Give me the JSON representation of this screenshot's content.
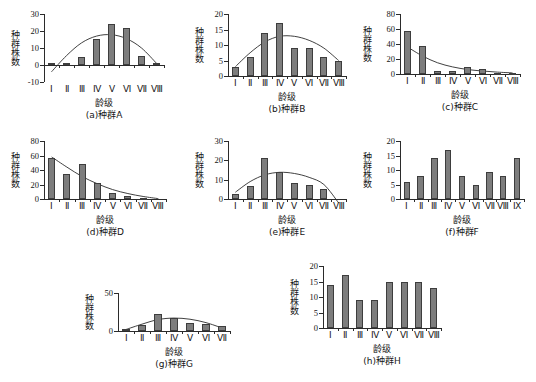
{
  "figure": {
    "axis_titles": {
      "y": "种群株数",
      "x": "龄级"
    },
    "bar_color": "#7d7d7d",
    "bar_edge_color": "#3d3d3d",
    "axis_color": "#2b2b2b",
    "background": "#ffffff"
  },
  "chart_data": [
    {
      "type": "bar",
      "id": "a",
      "title": "(a)种群A",
      "xlabel": "龄级",
      "ylabel": "种群株数",
      "categories": [
        "Ⅰ",
        "Ⅱ",
        "Ⅲ",
        "Ⅳ",
        "Ⅴ",
        "Ⅵ",
        "Ⅶ",
        "Ⅷ"
      ],
      "values": [
        1,
        1,
        5,
        15.5,
        24,
        22,
        5.5,
        1
      ],
      "yticks": [
        -10,
        0,
        10,
        20,
        30
      ],
      "ylim": [
        -10,
        30
      ],
      "grid": false,
      "legend": "none",
      "trend_curve": {
        "present": true,
        "shape": "unimodal-hump",
        "values": [
          -4,
          5.5,
          13,
          17,
          17.8,
          15.5,
          10,
          1
        ]
      }
    },
    {
      "type": "bar",
      "id": "b",
      "title": "(b)种群B",
      "xlabel": "龄级",
      "ylabel": "种群株数",
      "categories": [
        "Ⅰ",
        "Ⅱ",
        "Ⅲ",
        "Ⅳ",
        "Ⅴ",
        "Ⅵ",
        "Ⅶ",
        "Ⅷ"
      ],
      "values": [
        3,
        6,
        14,
        17,
        9,
        9,
        6,
        5
      ],
      "yticks": [
        0,
        5,
        10,
        15,
        20
      ],
      "ylim": [
        0,
        20
      ],
      "grid": false,
      "legend": "none",
      "trend_curve": {
        "present": true,
        "shape": "unimodal-hump",
        "values": [
          3,
          7.5,
          11,
          12.8,
          12.8,
          11.5,
          9,
          5
        ]
      }
    },
    {
      "type": "bar",
      "id": "c",
      "title": "(c)种群C",
      "xlabel": "龄级",
      "ylabel": "种群株数",
      "categories": [
        "Ⅰ",
        "Ⅱ",
        "Ⅲ",
        "Ⅳ",
        "Ⅴ",
        "Ⅵ",
        "Ⅶ",
        "Ⅷ"
      ],
      "values": [
        58,
        38,
        4,
        4,
        9,
        7,
        2,
        2
      ],
      "yticks": [
        0,
        20,
        40,
        60,
        80
      ],
      "ylim": [
        0,
        80
      ],
      "grid": false,
      "legend": "none",
      "trend_curve": {
        "present": true,
        "shape": "decay",
        "values": [
          36,
          24,
          15,
          9.5,
          6,
          4,
          2.5,
          1.5
        ]
      }
    },
    {
      "type": "bar",
      "id": "d",
      "title": "(d)种群D",
      "xlabel": "龄级",
      "ylabel": "种群株数",
      "categories": [
        "Ⅰ",
        "Ⅱ",
        "Ⅲ",
        "Ⅳ",
        "Ⅴ",
        "Ⅵ",
        "Ⅶ",
        "Ⅷ"
      ],
      "values": [
        57,
        35,
        48,
        22,
        8,
        4,
        1.5,
        0.5
      ],
      "yticks": [
        0,
        20,
        40,
        60,
        80
      ],
      "ylim": [
        0,
        80
      ],
      "grid": false,
      "legend": "none",
      "trend_curve": {
        "present": true,
        "shape": "decay",
        "values": [
          58,
          44,
          31,
          21,
          13,
          7.5,
          3.5,
          0.5
        ]
      }
    },
    {
      "type": "bar",
      "id": "e",
      "title": "(e)种群E",
      "xlabel": "龄级",
      "ylabel": "种群株数",
      "categories": [
        "Ⅰ",
        "Ⅱ",
        "Ⅲ",
        "Ⅳ",
        "Ⅴ",
        "Ⅵ",
        "Ⅶ",
        "Ⅷ"
      ],
      "values": [
        2.5,
        6.5,
        21,
        14,
        8.5,
        7,
        5,
        0
      ],
      "yticks": [
        0,
        10,
        20,
        30
      ],
      "ylim": [
        0,
        30
      ],
      "grid": false,
      "legend": "none",
      "trend_curve": {
        "present": true,
        "shape": "unimodal-hump",
        "values": [
          3.5,
          9,
          12.5,
          13.8,
          13.2,
          11.2,
          7.5,
          -2
        ]
      }
    },
    {
      "type": "bar",
      "id": "f",
      "title": "(f)种群F",
      "xlabel": "龄级",
      "ylabel": "种群株数",
      "categories": [
        "Ⅰ",
        "Ⅱ",
        "Ⅲ",
        "Ⅳ",
        "Ⅴ",
        "Ⅵ",
        "Ⅶ",
        "Ⅷ",
        "Ⅸ"
      ],
      "values": [
        6,
        8,
        14.3,
        17,
        8,
        5,
        9.2,
        8,
        14.2
      ],
      "yticks": [
        0,
        5,
        10,
        15,
        20
      ],
      "ylim": [
        0,
        20
      ],
      "grid": false,
      "legend": "none",
      "trend_curve": {
        "present": false,
        "shape": "none",
        "values": []
      }
    },
    {
      "type": "bar",
      "id": "g",
      "title": "(g)种群G",
      "xlabel": "龄级",
      "ylabel": "种群株数",
      "categories": [
        "Ⅰ",
        "Ⅱ",
        "Ⅲ",
        "Ⅳ",
        "Ⅴ",
        "Ⅵ",
        "Ⅶ"
      ],
      "values": [
        2,
        8,
        22,
        17,
        10,
        9,
        6
      ],
      "yticks": [
        0,
        50
      ],
      "ylim": [
        0,
        50
      ],
      "grid": false,
      "legend": "none",
      "trend_curve": {
        "present": true,
        "shape": "unimodal-hump",
        "values": [
          2,
          9,
          15,
          17,
          15.5,
          11,
          4
        ]
      }
    },
    {
      "type": "bar",
      "id": "h",
      "title": "(h)种群H",
      "xlabel": "龄级",
      "ylabel": "种群株数",
      "categories": [
        "Ⅰ",
        "Ⅱ",
        "Ⅲ",
        "Ⅳ",
        "Ⅴ",
        "Ⅵ",
        "Ⅶ",
        "Ⅷ"
      ],
      "values": [
        14,
        17,
        9,
        9,
        15,
        15,
        15,
        13
      ],
      "yticks": [
        0,
        5,
        10,
        15,
        20
      ],
      "ylim": [
        0,
        20
      ],
      "grid": false,
      "legend": "none",
      "trend_curve": {
        "present": false,
        "shape": "none",
        "values": []
      }
    }
  ],
  "layout": {
    "panels": [
      {
        "id": "a",
        "left": 6,
        "top": 6,
        "plot_left": 38,
        "plot_top": 8,
        "plot_w": 120,
        "plot_h": 68
      },
      {
        "id": "b",
        "left": 190,
        "top": 6,
        "plot_left": 38,
        "plot_top": 8,
        "plot_w": 118,
        "plot_h": 62
      },
      {
        "id": "c",
        "left": 358,
        "top": 6,
        "plot_left": 42,
        "plot_top": 8,
        "plot_w": 120,
        "plot_h": 60
      },
      {
        "id": "d",
        "left": 6,
        "top": 133,
        "plot_left": 38,
        "plot_top": 8,
        "plot_w": 122,
        "plot_h": 58
      },
      {
        "id": "e",
        "left": 190,
        "top": 133,
        "plot_left": 38,
        "plot_top": 8,
        "plot_w": 118,
        "plot_h": 58
      },
      {
        "id": "f",
        "left": 358,
        "top": 133,
        "plot_left": 42,
        "plot_top": 8,
        "plot_w": 124,
        "plot_h": 58
      },
      {
        "id": "g",
        "left": 80,
        "top": 285,
        "plot_left": 38,
        "plot_top": 8,
        "plot_w": 112,
        "plot_h": 38
      },
      {
        "id": "h",
        "left": 285,
        "top": 258,
        "plot_left": 38,
        "plot_top": 8,
        "plot_w": 118,
        "plot_h": 62
      }
    ]
  }
}
